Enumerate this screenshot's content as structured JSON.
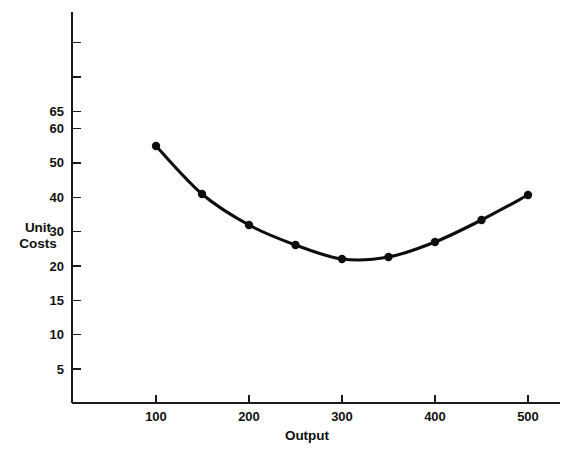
{
  "chart_data": {
    "type": "line",
    "title": "",
    "xlabel": "Output",
    "ylabel": "Unit Costs",
    "ylabel_line1": "Unit",
    "ylabel_line2": "Costs",
    "x": [
      100,
      150,
      200,
      250,
      300,
      350,
      400,
      450,
      500
    ],
    "values": [
      59,
      41.5,
      33,
      28.5,
      27,
      27.5,
      29,
      34.5,
      41.5
    ],
    "series": [
      {
        "name": "Unit Costs",
        "values": [
          59,
          41.5,
          33,
          28.5,
          27,
          27.5,
          29,
          34.5,
          41.5
        ]
      }
    ],
    "xlim": [
      55,
      545
    ],
    "ylim": [
      0,
      80
    ],
    "x_tick_labels": [
      "100",
      "200",
      "300",
      "400",
      "500"
    ],
    "x_tick_values": [
      100,
      200,
      300,
      400,
      500
    ],
    "y_tick_labels": [
      "5",
      "10",
      "15",
      "20",
      "30",
      "40",
      "50",
      "60",
      "65"
    ],
    "y_tick_values": [
      5,
      10,
      15,
      20,
      30,
      40,
      50,
      60,
      65
    ],
    "y_axis_scale": "non-uniform categorical ticks evenly spaced",
    "grid": false,
    "legend": false,
    "legend_position": "none",
    "marker": "filled-circle",
    "line_color": "#0d0d0d",
    "marker_color": "#0d0d0d",
    "background_color": "#ffffff",
    "annotations": []
  },
  "geometry": {
    "axis_x": 72,
    "axis_y_bottom": 403,
    "axis_y_top": 12,
    "axis_x_right": 560,
    "y_tick_pixels": [
      369,
      334.7,
      300.3,
      266,
      231.6,
      197.3,
      162.9,
      128.6,
      111.4
    ],
    "y_tick_extra_unlabeled": [
      77,
      42.6
    ],
    "x_tick_pixels": [
      156,
      249,
      342,
      435,
      528
    ],
    "point_pixels": [
      {
        "x": 156,
        "y": 146
      },
      {
        "x": 202,
        "y": 194
      },
      {
        "x": 249,
        "y": 225
      },
      {
        "x": 295.5,
        "y": 245
      },
      {
        "x": 342,
        "y": 259
      },
      {
        "x": 388.5,
        "y": 257
      },
      {
        "x": 435,
        "y": 242
      },
      {
        "x": 481.5,
        "y": 220
      },
      {
        "x": 528,
        "y": 195
      }
    ],
    "tick_len_y": 9,
    "tick_len_x": 8
  }
}
